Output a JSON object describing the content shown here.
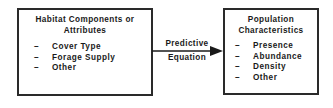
{
  "left_box": {
    "title_line1": "Habitat Components or",
    "title_line2": "Attributes",
    "bullet": "–",
    "items": [
      "Cover Type",
      "Forage Supply",
      "Other"
    ]
  },
  "arrow": {
    "label_line1": "Predictive",
    "label_line2": "Equation"
  },
  "right_box": {
    "title_line1": "Population",
    "title_line2": "Characteristics",
    "bullet": "–",
    "items": [
      "Presence",
      "Abundance",
      "Density",
      "Other"
    ]
  }
}
